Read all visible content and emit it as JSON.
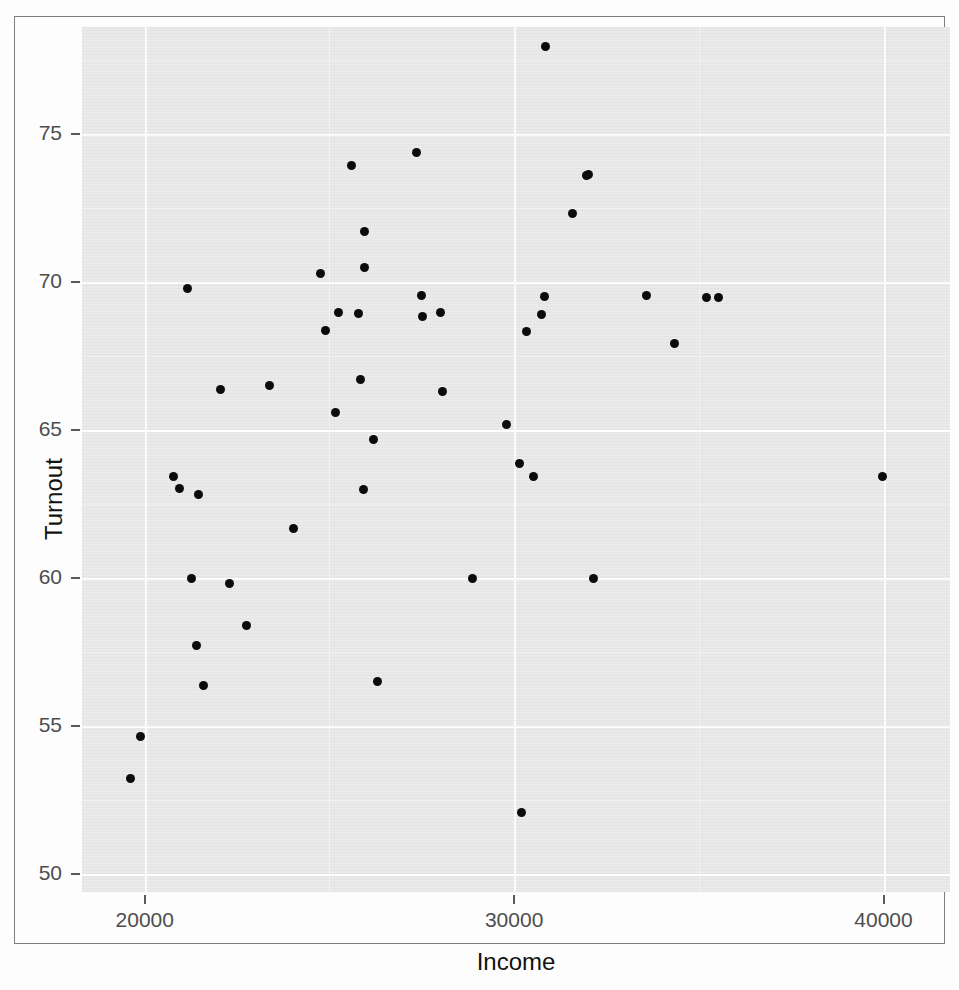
{
  "figure": {
    "kind": "scatter-plot",
    "style": "ggplot2-grey-theme"
  },
  "page_bleed_text": [
    "mechanisms that link economic resources to the act of voting",
    "turnout rates across states remain stubbornly uneven, and the",
    "gap widens with income",
    "models are estimated below, and the scatter of state averages",
    "suggests a positive but noisy association between the two"
  ],
  "chart_data": {
    "type": "scatter",
    "title": "",
    "xlabel": "Income",
    "ylabel": "Turnout",
    "xlim": [
      18300,
      41800
    ],
    "ylim": [
      49.4,
      78.6
    ],
    "xticks": [
      20000,
      30000,
      40000
    ],
    "xtick_labels": [
      "20000",
      "30000",
      "40000"
    ],
    "yticks": [
      50,
      55,
      60,
      65,
      70,
      75
    ],
    "ytick_labels": [
      "50",
      "55",
      "60",
      "65",
      "70",
      "75"
    ],
    "x_minor_ticks": [
      25000,
      35000
    ],
    "y_minor_ticks": [
      52.5,
      57.5,
      62.5,
      67.5,
      72.5,
      77.5
    ],
    "grid": true,
    "legend": "none",
    "point_color": "#0c0c0c",
    "point_size": 9,
    "n_points": 48,
    "x": [
      21300,
      21500,
      22400,
      22700,
      22800,
      23000,
      23000,
      23300,
      23400,
      23500,
      23800,
      24000,
      24100,
      24400,
      24600,
      24700,
      24800,
      24800,
      24900,
      25000,
      25000,
      25100,
      25200,
      25300,
      25400,
      25500,
      25600,
      25700,
      25900,
      26300,
      26500,
      26900,
      27300,
      28300,
      28500,
      28800,
      28900,
      29000,
      29000,
      29100,
      29300,
      29600,
      30600,
      30900,
      31900,
      33600,
      34700,
      34900,
      40700
    ],
    "y": [
      52.1,
      53.1,
      67.5,
      62.1,
      61.8,
      58.9,
      61.6,
      56.8,
      55.6,
      58.8,
      65.0,
      65.1,
      57.4,
      60.5,
      68.7,
      67.5,
      66.9,
      64.3,
      72.2,
      70.1,
      68.9,
      67.5,
      65.3,
      63.4,
      61.8,
      55.7,
      68.2,
      72.6,
      67.6,
      67.4,
      65.0,
      58.9,
      63.9,
      51.0,
      62.5,
      62.1,
      66.9,
      77.6,
      67.5,
      68.1,
      70.8,
      72.0,
      58.9,
      71.9,
      68.1,
      66.5,
      68.0,
      68.0,
      62.1
    ],
    "points": [
      {
        "x": 21300,
        "y": 52.1,
        "px": 5.6,
        "py": 86.9
      },
      {
        "x": 21500,
        "y": 53.1,
        "px": 6.7,
        "py": 82.0
      },
      {
        "x": 22400,
        "y": 67.5,
        "px": 12.1,
        "py": 30.2
      },
      {
        "x": 22700,
        "y": 62.1,
        "px": 10.5,
        "py": 52.0
      },
      {
        "x": 22800,
        "y": 61.8,
        "px": 11.2,
        "py": 53.3
      },
      {
        "x": 23000,
        "y": 58.9,
        "px": 12.6,
        "py": 63.8
      },
      {
        "x": 23000,
        "y": 61.6,
        "px": 13.4,
        "py": 54.1
      },
      {
        "x": 23300,
        "y": 56.8,
        "px": 13.2,
        "py": 71.5
      },
      {
        "x": 23400,
        "y": 55.6,
        "px": 14.0,
        "py": 76.1
      },
      {
        "x": 23500,
        "y": 58.8,
        "px": 17.0,
        "py": 64.3
      },
      {
        "x": 23800,
        "y": 65.0,
        "px": 15.9,
        "py": 41.9
      },
      {
        "x": 24000,
        "y": 65.1,
        "px": 21.6,
        "py": 41.4
      },
      {
        "x": 24100,
        "y": 57.4,
        "px": 18.9,
        "py": 69.2
      },
      {
        "x": 24400,
        "y": 60.5,
        "px": 24.4,
        "py": 58.0
      },
      {
        "x": 24600,
        "y": 68.7,
        "px": 27.5,
        "py": 28.5
      },
      {
        "x": 24700,
        "y": 67.5,
        "px": 29.5,
        "py": 33.0
      },
      {
        "x": 24800,
        "y": 66.9,
        "px": 28.0,
        "py": 35.1
      },
      {
        "x": 24800,
        "y": 64.3,
        "px": 29.2,
        "py": 44.6
      },
      {
        "x": 24900,
        "y": 72.2,
        "px": 31.1,
        "py": 16.0
      },
      {
        "x": 25000,
        "y": 70.1,
        "px": 32.5,
        "py": 23.6
      },
      {
        "x": 25000,
        "y": 68.9,
        "px": 32.6,
        "py": 27.8
      },
      {
        "x": 25100,
        "y": 67.5,
        "px": 31.8,
        "py": 33.1
      },
      {
        "x": 25200,
        "y": 65.3,
        "px": 32.1,
        "py": 40.7
      },
      {
        "x": 25300,
        "y": 63.4,
        "px": 33.6,
        "py": 47.7
      },
      {
        "x": 25400,
        "y": 61.8,
        "px": 32.4,
        "py": 53.5
      },
      {
        "x": 25500,
        "y": 55.7,
        "px": 34.0,
        "py": 75.7
      },
      {
        "x": 25600,
        "y": 68.2,
        "px": 39.1,
        "py": 31.0
      },
      {
        "x": 25700,
        "y": 72.6,
        "px": 38.5,
        "py": 14.5
      },
      {
        "x": 25900,
        "y": 67.6,
        "px": 41.3,
        "py": 33.0
      },
      {
        "x": 26300,
        "y": 67.4,
        "px": 39.2,
        "py": 33.5
      },
      {
        "x": 26500,
        "y": 65.0,
        "px": 41.5,
        "py": 42.1
      },
      {
        "x": 26900,
        "y": 58.9,
        "px": 45.0,
        "py": 63.8
      },
      {
        "x": 27300,
        "y": 63.9,
        "px": 48.9,
        "py": 45.9
      },
      {
        "x": 28300,
        "y": 51.0,
        "px": 50.6,
        "py": 90.8
      },
      {
        "x": 28500,
        "y": 62.5,
        "px": 50.4,
        "py": 50.5
      },
      {
        "x": 28800,
        "y": 62.1,
        "px": 52.0,
        "py": 52.0
      },
      {
        "x": 28900,
        "y": 66.9,
        "px": 51.2,
        "py": 35.2
      },
      {
        "x": 29000,
        "y": 77.6,
        "px": 53.4,
        "py": 2.2
      },
      {
        "x": 29000,
        "y": 67.5,
        "px": 52.9,
        "py": 33.2
      },
      {
        "x": 29100,
        "y": 68.1,
        "px": 53.3,
        "py": 31.1
      },
      {
        "x": 29300,
        "y": 70.8,
        "px": 56.5,
        "py": 21.6
      },
      {
        "x": 29600,
        "y": 72.0,
        "px": 58.3,
        "py": 17.0
      },
      {
        "x": 30600,
        "y": 58.9,
        "px": 58.9,
        "py": 63.8
      },
      {
        "x": 30900,
        "y": 71.9,
        "px": 58.1,
        "py": 17.2
      },
      {
        "x": 31900,
        "y": 68.1,
        "px": 65.0,
        "py": 31.0
      },
      {
        "x": 33600,
        "y": 66.5,
        "px": 68.3,
        "py": 36.6
      },
      {
        "x": 34700,
        "y": 68.0,
        "px": 71.9,
        "py": 31.3
      },
      {
        "x": 34900,
        "y": 68.0,
        "px": 73.3,
        "py": 31.3
      },
      {
        "x": 40700,
        "y": 62.1,
        "px": 92.2,
        "py": 52.0
      }
    ]
  }
}
